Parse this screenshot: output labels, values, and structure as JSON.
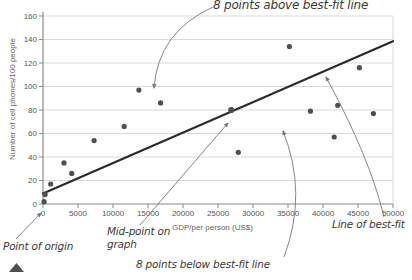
{
  "chart_data": {
    "type": "scatter",
    "title": "",
    "xlabel": "GDP/per person (US$)",
    "ylabel": "Number of cell phones/100 people",
    "xlim": [
      0,
      50000
    ],
    "ylim": [
      0,
      160
    ],
    "x_ticks": [
      0,
      5000,
      10000,
      15000,
      20000,
      25000,
      30000,
      35000,
      40000,
      45000,
      50000
    ],
    "y_ticks": [
      0,
      20,
      40,
      60,
      80,
      100,
      120,
      140,
      160
    ],
    "grid": "horizontal",
    "legend": "none",
    "series": [
      {
        "name": "points above best-fit line",
        "points": [
          [
            1100,
            17
          ],
          [
            3000,
            35
          ],
          [
            4100,
            26
          ],
          [
            7300,
            54
          ],
          [
            11600,
            66
          ],
          [
            13700,
            97
          ],
          [
            16800,
            86
          ],
          [
            35200,
            134
          ]
        ]
      },
      {
        "name": "points below best-fit line",
        "points": [
          [
            150,
            2
          ],
          [
            300,
            8
          ],
          [
            27900,
            44
          ],
          [
            38200,
            79
          ],
          [
            41600,
            57
          ],
          [
            42100,
            84
          ],
          [
            45200,
            116
          ],
          [
            47200,
            77
          ]
        ]
      },
      {
        "name": "mid-point on graph",
        "points": [
          [
            26900,
            80
          ]
        ]
      }
    ],
    "best_fit_line": {
      "x1": 0,
      "y1": 9,
      "x2": 50000,
      "y2": 138.5
    }
  },
  "annotations": {
    "points_above": {
      "label": "8 points above best-fit line",
      "pointer_path": "M 213 7 Q 158 32 154 88"
    },
    "points_below": {
      "label": "8 points below best-fit line",
      "pointer_path": "M 284 257 Q 308 193 283 131"
    },
    "point_of_origin": {
      "label": "Point of origin",
      "pointer_path": "M 16 239 L 41 213"
    },
    "mid_point": {
      "label": "Mid-point on graph",
      "pointer_path": "M 140 225 L 228 123"
    },
    "line_of_best_fit": {
      "label": "Line of best-fit",
      "pointer_path": "M 384 217 Q 370 158 326 77"
    }
  },
  "colors": {
    "point": "#4f4f4f",
    "best_fit_line": "#2b2b2b",
    "grid": "#d9d9d9",
    "axis": "#8a8a8a",
    "pointer": "#777777",
    "annotation_text": "#3a3a3a",
    "tick_text": "#555555"
  }
}
